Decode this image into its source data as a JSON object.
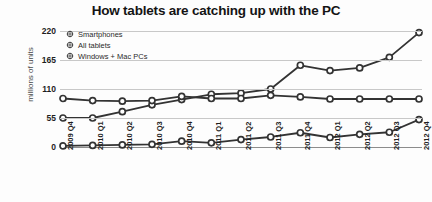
{
  "chart_data": {
    "type": "line",
    "title": "How tablets are catching up with the PC",
    "xlabel": "",
    "ylabel": "millions of units",
    "ylim": [
      0,
      220
    ],
    "yticks": [
      0,
      55,
      110,
      165,
      220
    ],
    "grid": true,
    "legend_position": "top-left",
    "categories": [
      "2009 Q4",
      "2010 Q1",
      "2010 Q2",
      "2010 Q3",
      "2010 Q4",
      "2011 Q1",
      "2011 Q2",
      "2011 Q3",
      "2011 Q4",
      "2012 Q1",
      "2012 Q2",
      "2012 Q3",
      "2012 Q4"
    ],
    "series": [
      {
        "name": "Smartphones",
        "color": "#333333",
        "values": [
          55,
          55,
          67,
          80,
          90,
          100,
          102,
          110,
          155,
          145,
          150,
          170,
          217
        ]
      },
      {
        "name": "All tablets",
        "color": "#333333",
        "values": [
          2,
          3,
          4,
          5,
          11,
          8,
          14,
          19,
          27,
          18,
          24,
          28,
          52
        ]
      },
      {
        "name": "Windows + Mac PCs",
        "color": "#333333",
        "values": [
          92,
          88,
          87,
          88,
          96,
          92,
          92,
          98,
          95,
          91,
          91,
          91,
          91
        ]
      }
    ]
  },
  "legend": {
    "items": [
      {
        "label": "Smartphones"
      },
      {
        "label": "All tablets"
      },
      {
        "label": "Windows + Mac PCs"
      }
    ]
  },
  "axes": {
    "y_title": "millions of units",
    "y_labels": [
      "220",
      "165",
      "110",
      "55",
      "0"
    ],
    "x_labels": [
      "2009 Q4",
      "2010 Q1",
      "2010 Q2",
      "2010 Q3",
      "2010 Q4",
      "2011 Q1",
      "2011 Q2",
      "2011 Q3",
      "2011 Q4",
      "2012 Q1",
      "2012 Q2",
      "2012 Q3",
      "2012 Q4"
    ]
  }
}
